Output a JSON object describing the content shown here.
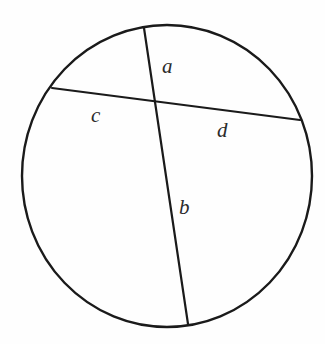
{
  "figure": {
    "type": "geometry-diagram",
    "background_color": "#fefefe",
    "stroke_color": "#1a1a1a",
    "label_color": "#2b2b2b"
  },
  "circle": {
    "center_x": 167,
    "center_y": 176,
    "radius_x": 145,
    "radius_y": 151,
    "stroke_width": 2.4
  },
  "chords": [
    {
      "name": "chord-ab",
      "x1": 144,
      "y1": 28,
      "x2": 188,
      "y2": 324,
      "stroke_width": 2.2
    },
    {
      "name": "chord-cd",
      "x1": 52,
      "y1": 88,
      "x2": 300,
      "y2": 120,
      "stroke_width": 2.2
    }
  ],
  "intersection": {
    "x": 155,
    "y": 103
  },
  "labels": {
    "a": "a",
    "b": "b",
    "c": "c",
    "d": "d"
  }
}
